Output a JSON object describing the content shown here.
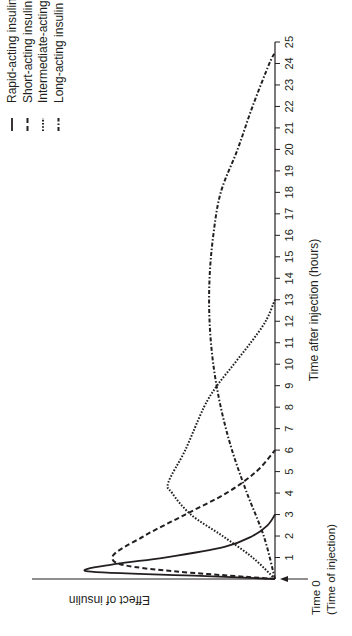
{
  "chart_data": {
    "type": "line",
    "title": "",
    "xlabel": "Time after injection (hours)",
    "ylabel": "Effect of insulin",
    "x_origin_label": "Time 0",
    "x_origin_sublabel": "(Time of injection)",
    "xlim": [
      0,
      25
    ],
    "ylim": [
      0,
      100
    ],
    "x_ticks": [
      1,
      2,
      3,
      4,
      5,
      6,
      7,
      8,
      9,
      10,
      11,
      12,
      13,
      14,
      15,
      16,
      17,
      18,
      19,
      20,
      21,
      22,
      23,
      24,
      25
    ],
    "orientation": "rotated 90 degrees (time axis vertical, effect increases leftward)",
    "legend_position": "top-left",
    "series": [
      {
        "name": "Rapid-acting insulin",
        "style": "solid",
        "x": [
          0,
          0.15,
          0.35,
          0.7,
          1,
          1.5,
          2,
          2.5,
          3
        ],
        "values": [
          0,
          40,
          100,
          85,
          59,
          27,
          12,
          4,
          0
        ]
      },
      {
        "name": "Short-acting insulin",
        "style": "dashed",
        "x": [
          0,
          0.5,
          1,
          2,
          3,
          4,
          5,
          6
        ],
        "values": [
          0,
          70,
          87,
          70,
          48,
          26,
          10,
          0
        ]
      },
      {
        "name": "Intermediate-acting insulin",
        "style": "dotted",
        "x": [
          0,
          1,
          2,
          3,
          4,
          4.5,
          6,
          8,
          9,
          10,
          11,
          12,
          13
        ],
        "values": [
          0,
          12,
          28,
          45,
          55,
          57,
          48,
          38,
          31,
          22,
          13,
          5,
          0
        ]
      },
      {
        "name": "Long-acting insulin",
        "style": "dash-dot",
        "x": [
          0,
          2,
          4,
          6,
          8,
          10,
          12,
          14,
          16,
          18,
          20,
          22,
          24,
          24.5
        ],
        "values": [
          0,
          6,
          15,
          23,
          29,
          33,
          35,
          35,
          33,
          29,
          20,
          12,
          3,
          0
        ]
      }
    ]
  },
  "colors": {
    "line": "#231f20",
    "background": "#ffffff"
  }
}
